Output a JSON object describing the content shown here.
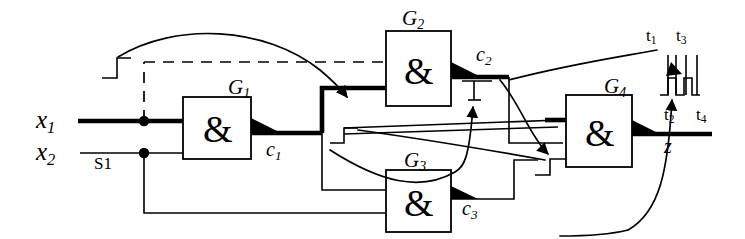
{
  "figure": {
    "kind": "logic-circuit-diagram",
    "background_color": "#ffffff",
    "line_color": "#000000",
    "highlight_color": "#000000"
  },
  "inputs": [
    {
      "id": "x1",
      "base": "x",
      "sub": "1",
      "label": "x1",
      "emphasized": true
    },
    {
      "id": "x2",
      "base": "x",
      "sub": "2",
      "label": "x2",
      "emphasized": false
    }
  ],
  "annotations": {
    "s1": "S1"
  },
  "gates": [
    {
      "id": "G1",
      "base": "G",
      "sub": "1",
      "label": "G1",
      "symbol": "&",
      "output": "c1"
    },
    {
      "id": "G2",
      "base": "G",
      "sub": "2",
      "label": "G2",
      "symbol": "&",
      "output": "c2"
    },
    {
      "id": "G3",
      "base": "G",
      "sub": "3",
      "label": "G3",
      "symbol": "&",
      "output": "c3"
    },
    {
      "id": "G4",
      "base": "G",
      "sub": "4",
      "label": "G4",
      "symbol": "&",
      "output": "z"
    }
  ],
  "signals": [
    {
      "id": "c1",
      "base": "c",
      "sub": "1",
      "label": "c1"
    },
    {
      "id": "c2",
      "base": "c",
      "sub": "2",
      "label": "c2"
    },
    {
      "id": "c3",
      "base": "c",
      "sub": "3",
      "label": "c3"
    },
    {
      "id": "z",
      "base": "z",
      "sub": "",
      "label": "z"
    }
  ],
  "timing_marks": [
    {
      "id": "t1",
      "base": "t",
      "sub": "1",
      "label": "t1"
    },
    {
      "id": "t2",
      "base": "t",
      "sub": "2",
      "label": "t2"
    },
    {
      "id": "t3",
      "base": "t",
      "sub": "3",
      "label": "t3"
    },
    {
      "id": "t4",
      "base": "t",
      "sub": "4",
      "label": "t4"
    }
  ],
  "waveform_markers": [
    {
      "id": "wf-x1",
      "on": "x1-input-line",
      "type": "rising-step"
    },
    {
      "id": "wf-c2",
      "on": "c2-output-line",
      "type": "pulse-step"
    },
    {
      "id": "wf-g4-in",
      "on": "g4-lower-input",
      "type": "rising-step"
    },
    {
      "id": "wf-g2-in",
      "on": "g2-lower-input",
      "type": "rising-step"
    },
    {
      "id": "wf-z",
      "on": "z-output-line",
      "type": "glitch-pulse"
    }
  ],
  "gate_symbol": "&"
}
